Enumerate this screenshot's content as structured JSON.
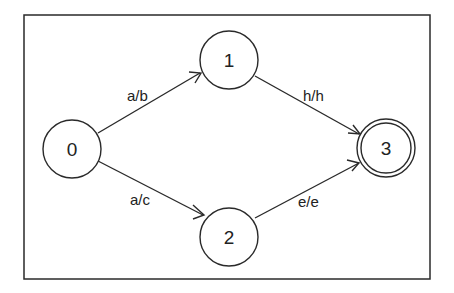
{
  "diagram": {
    "type": "finite-state-transducer",
    "frame": {
      "x": 24,
      "y": 15,
      "width": 406,
      "height": 264,
      "stroke": "#2a2a2a"
    },
    "nodes": [
      {
        "id": "0",
        "label": "0",
        "x": 72,
        "y": 149,
        "r": 29,
        "accepting": false
      },
      {
        "id": "1",
        "label": "1",
        "x": 229,
        "y": 60,
        "r": 29,
        "accepting": false
      },
      {
        "id": "2",
        "label": "2",
        "x": 229,
        "y": 237,
        "r": 29,
        "accepting": false
      },
      {
        "id": "3",
        "label": "3",
        "x": 386,
        "y": 148,
        "r": 29,
        "accepting": true
      }
    ],
    "edges": [
      {
        "from": "0",
        "to": "1",
        "label": "a/b"
      },
      {
        "from": "0",
        "to": "2",
        "label": "a/c"
      },
      {
        "from": "1",
        "to": "3",
        "label": "h/h"
      },
      {
        "from": "2",
        "to": "3",
        "label": "e/e"
      }
    ],
    "colors": {
      "stroke": "#2a2a2a",
      "text": "#222222",
      "background": "#ffffff"
    }
  }
}
